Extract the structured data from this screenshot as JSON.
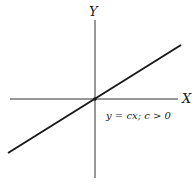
{
  "diagram": {
    "y_axis_label": "Y",
    "x_axis_label": "X",
    "equation_label": "y = cx; c > 0",
    "line_color": "#1a1a1a",
    "axis_color": "#333333"
  }
}
